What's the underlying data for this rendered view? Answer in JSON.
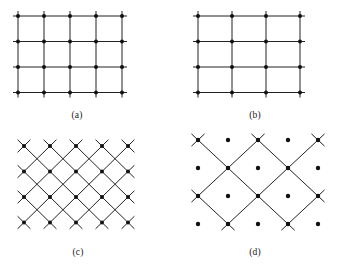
{
  "figure": {
    "background_color": "#ffffff",
    "line_color": "#222222",
    "dot_color": "#111111",
    "panels": [
      {
        "id": "a",
        "caption": "(a)",
        "type": "orthogonal-grid",
        "description": "square lattice with vertical and horizontal lattice planes, dots at every intersection",
        "x": 10,
        "y": 8,
        "width": 135,
        "height": 100,
        "vertical_lines": 5,
        "horizontal_lines": 4,
        "col_spacing": 26,
        "row_spacing": 25.5,
        "overhang": 5,
        "dot_radius": 2.0,
        "line_width": 1.0,
        "caption_x": 57,
        "caption_y": 110
      },
      {
        "id": "b",
        "caption": "(b)",
        "type": "orthogonal-grid",
        "description": "square lattice with wider-spaced vertical lattice planes, dots at every intersection",
        "x": 190,
        "y": 8,
        "width": 135,
        "height": 100,
        "vertical_lines": 4,
        "horizontal_lines": 4,
        "col_spacing": 34,
        "row_spacing": 25.5,
        "overhang": 5,
        "dot_radius": 2.0,
        "line_width": 1.0,
        "caption_x": 235,
        "caption_y": 110
      },
      {
        "id": "c",
        "caption": "(c)",
        "type": "diagonal-lattice",
        "description": "same lattice with close-spaced 45-degree lattice planes; dots on lattice sites",
        "x": 14,
        "y": 136,
        "width": 140,
        "height": 104,
        "dot_cols": 5,
        "dot_rows": 4,
        "col_spacing": 26,
        "row_spacing": 25.5,
        "diagonal_step": 1,
        "dot_radius": 2.0,
        "line_width": 1.0,
        "caption_x": 58,
        "caption_y": 247
      },
      {
        "id": "d",
        "caption": "(d)",
        "type": "diagonal-lattice",
        "description": "same lattice with wider-spaced 45-degree lattice planes; dots on lattice sites",
        "x": 188,
        "y": 130,
        "width": 146,
        "height": 110,
        "dot_cols": 5,
        "dot_rows": 4,
        "col_spacing": 30,
        "row_spacing": 28,
        "diagonal_step": 2,
        "dot_radius": 2.2,
        "line_width": 1.0,
        "caption_x": 235,
        "caption_y": 247
      }
    ]
  }
}
